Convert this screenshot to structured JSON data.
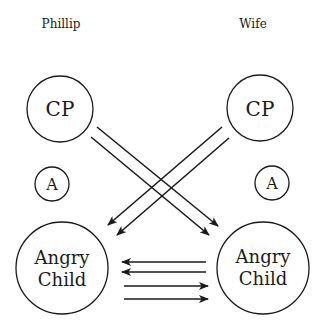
{
  "diagram": {
    "type": "transactional-analysis",
    "columns": [
      {
        "label": "Phillip"
      },
      {
        "label": "Wife"
      }
    ],
    "nodes": {
      "phillip_cp": {
        "label": "CP"
      },
      "phillip_a": {
        "label": "A"
      },
      "phillip_child_line1": {
        "label": "Angry"
      },
      "phillip_child_line2": {
        "label": "Child"
      },
      "wife_cp": {
        "label": "CP"
      },
      "wife_a": {
        "label": "A"
      },
      "wife_child_line1": {
        "label": "Angry"
      },
      "wife_child_line2": {
        "label": "Child"
      }
    },
    "edges": [
      {
        "from": "Phillip CP",
        "to": "Wife Angry Child",
        "count": 2
      },
      {
        "from": "Wife CP",
        "to": "Phillip Angry Child",
        "count": 2
      },
      {
        "from": "Wife Angry Child",
        "to": "Phillip Angry Child",
        "count": 2
      },
      {
        "from": "Phillip Angry Child",
        "to": "Wife Angry Child",
        "count": 2
      }
    ],
    "colors": {
      "ink": "#1a1a1a",
      "background": "#ffffff"
    }
  }
}
